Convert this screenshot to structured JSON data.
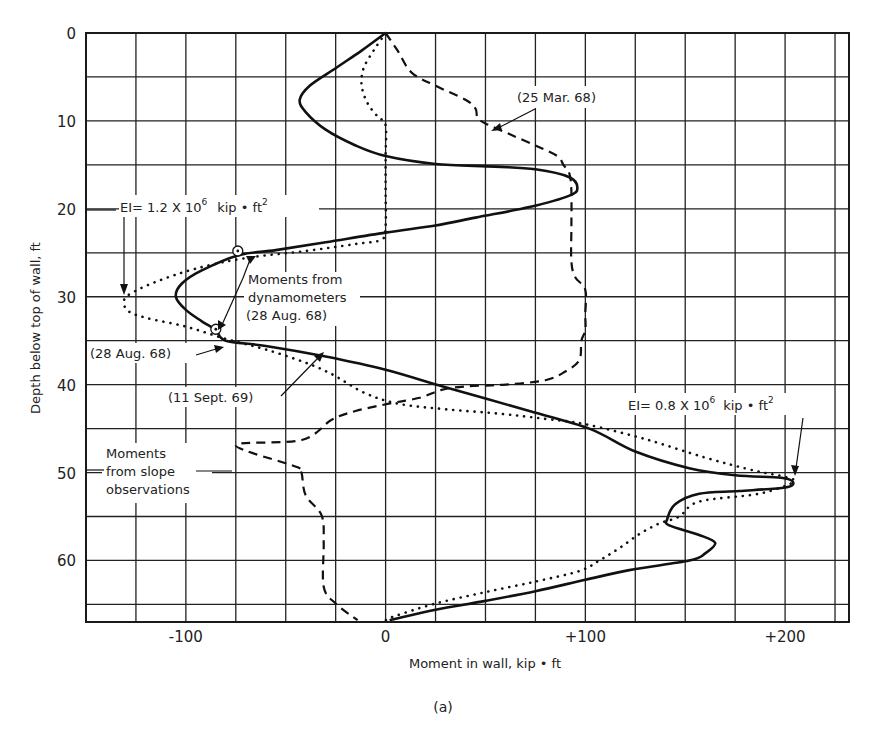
{
  "chart_data": {
    "type": "line",
    "title": "",
    "caption": "(a)",
    "xlabel": "Moment in wall, kip • ft",
    "ylabel": "Depth below top of wall, ft",
    "xlim": [
      -150,
      232
    ],
    "ylim": [
      0,
      67
    ],
    "y_inverted": true,
    "grid": true,
    "x_grid_step": 25,
    "y_grid_step": 5,
    "x_ticks": [
      {
        "value": -100,
        "label": "-100"
      },
      {
        "value": 0,
        "label": "0"
      },
      {
        "value": 100,
        "label": "+100"
      },
      {
        "value": 200,
        "label": "+200"
      }
    ],
    "y_ticks": [
      {
        "value": 0,
        "label": "0"
      },
      {
        "value": 10,
        "label": "10"
      },
      {
        "value": 20,
        "label": "20"
      },
      {
        "value": 30,
        "label": "30"
      },
      {
        "value": 40,
        "label": "40"
      },
      {
        "value": 50,
        "label": "50"
      },
      {
        "value": 60,
        "label": "60"
      }
    ],
    "series": [
      {
        "name": "(11 Sept. 69)",
        "style": "solid",
        "points": [
          [
            0,
            0
          ],
          [
            -12,
            2
          ],
          [
            -25,
            4
          ],
          [
            -38,
            6
          ],
          [
            -43,
            7.6
          ],
          [
            -40,
            9
          ],
          [
            -30,
            11
          ],
          [
            -15,
            12.8
          ],
          [
            0,
            14
          ],
          [
            25,
            14.9
          ],
          [
            55,
            15.2
          ],
          [
            75,
            15.5
          ],
          [
            92,
            16.4
          ],
          [
            96,
            17.6
          ],
          [
            92,
            18.5
          ],
          [
            72,
            19.8
          ],
          [
            45,
            21
          ],
          [
            25,
            21.9
          ],
          [
            0,
            22.7
          ],
          [
            -30,
            23.8
          ],
          [
            -55,
            24.7
          ],
          [
            -74,
            25.3
          ],
          [
            -92,
            27
          ],
          [
            -102,
            28.5
          ],
          [
            -105,
            30
          ],
          [
            -100,
            31.5
          ],
          [
            -92,
            32.8
          ],
          [
            -85,
            33.8
          ],
          [
            -80,
            35
          ],
          [
            -60,
            35.6
          ],
          [
            -30,
            36.8
          ],
          [
            0,
            38.3
          ],
          [
            30,
            40.3
          ],
          [
            72,
            43
          ],
          [
            102,
            45
          ],
          [
            125,
            47.6
          ],
          [
            152,
            49.5
          ],
          [
            175,
            50.3
          ],
          [
            198,
            50.6
          ],
          [
            204,
            51.1
          ],
          [
            200,
            51.7
          ],
          [
            177,
            52.1
          ],
          [
            157,
            52.4
          ],
          [
            145,
            53.6
          ],
          [
            141,
            55.3
          ],
          [
            142,
            56
          ],
          [
            157,
            57.1
          ],
          [
            165,
            58
          ],
          [
            160,
            59.2
          ],
          [
            152,
            60
          ],
          [
            122,
            61.1
          ],
          [
            100,
            62.2
          ],
          [
            75,
            63.5
          ],
          [
            50,
            64.6
          ],
          [
            25,
            65.6
          ],
          [
            2,
            66.8
          ]
        ]
      },
      {
        "name": "(28 Aug. 68)",
        "style": "dotted",
        "points": [
          [
            0,
            0
          ],
          [
            -6,
            2
          ],
          [
            -11,
            4
          ],
          [
            -12,
            6
          ],
          [
            -9,
            8
          ],
          [
            -4,
            9.5
          ],
          [
            0,
            10.5
          ],
          [
            0,
            14
          ],
          [
            0,
            18
          ],
          [
            0,
            22
          ],
          [
            -2,
            23.5
          ],
          [
            -15,
            24
          ],
          [
            -40,
            24.8
          ],
          [
            -70,
            25.6
          ],
          [
            -95,
            26.8
          ],
          [
            -115,
            28.3
          ],
          [
            -128,
            29.7
          ],
          [
            -131,
            30.5
          ],
          [
            -129,
            31.6
          ],
          [
            -120,
            32.4
          ],
          [
            -100,
            33.4
          ],
          [
            -80,
            34.8
          ],
          [
            -60,
            36
          ],
          [
            -40,
            37.5
          ],
          [
            -27,
            38.8
          ],
          [
            -10,
            41
          ],
          [
            7,
            42.2
          ],
          [
            30,
            42.8
          ],
          [
            57,
            43.3
          ],
          [
            80,
            43.9
          ],
          [
            100,
            44.5
          ],
          [
            130,
            46.2
          ],
          [
            160,
            48.3
          ],
          [
            185,
            49.8
          ],
          [
            200,
            50.5
          ],
          [
            204,
            51.1
          ],
          [
            187,
            52.4
          ],
          [
            157,
            53.3
          ],
          [
            147,
            55
          ],
          [
            137,
            55.8
          ],
          [
            127,
            57
          ],
          [
            117,
            58.6
          ],
          [
            107,
            60
          ],
          [
            97,
            61.2
          ],
          [
            75,
            62.4
          ],
          [
            50,
            63.6
          ],
          [
            25,
            64.9
          ],
          [
            5,
            66.3
          ],
          [
            0,
            66.8
          ]
        ]
      },
      {
        "name": "(25 Mar. 68)",
        "style": "dashed",
        "points": [
          [
            0,
            0
          ],
          [
            6,
            2
          ],
          [
            13,
            4.5
          ],
          [
            25,
            6
          ],
          [
            40,
            7.6
          ],
          [
            45,
            8.6
          ],
          [
            46,
            9.6
          ],
          [
            50,
            10.3
          ],
          [
            62,
            11.5
          ],
          [
            75,
            12.8
          ],
          [
            86,
            14
          ],
          [
            89,
            15
          ],
          [
            92,
            16
          ],
          [
            93,
            18
          ],
          [
            93,
            22
          ],
          [
            93,
            26
          ],
          [
            95,
            27.8
          ],
          [
            100,
            29.2
          ],
          [
            100,
            32
          ],
          [
            100,
            33.8
          ],
          [
            98,
            35
          ],
          [
            97,
            37.2
          ],
          [
            90,
            38.5
          ],
          [
            80,
            39.5
          ],
          [
            60,
            40
          ],
          [
            40,
            40.2
          ],
          [
            28,
            40.6
          ],
          [
            17,
            41.5
          ],
          [
            3,
            42.1
          ],
          [
            -15,
            43
          ],
          [
            -27,
            44
          ],
          [
            -42,
            46.3
          ],
          [
            -75,
            46.9
          ],
          [
            -44,
            49.4
          ],
          [
            -42,
            50.1
          ],
          [
            -40,
            52.6
          ],
          [
            -32,
            54.9
          ],
          [
            -31,
            58
          ],
          [
            -31,
            63
          ],
          [
            -25,
            64.9
          ],
          [
            -14,
            66.8
          ]
        ]
      }
    ],
    "markers": [
      {
        "name": "dynamometer-reading-1",
        "x": -74,
        "y": 24.8,
        "shape": "circle-dot"
      },
      {
        "name": "dynamometer-reading-2",
        "x": -85,
        "y": 33.7,
        "shape": "circle-dot"
      }
    ],
    "annotations": [
      {
        "id": "mar68",
        "text": "(25 Mar. 68)"
      },
      {
        "id": "ei12_main",
        "text": "EI= 1.2 X 10",
        "sup": "6",
        "tail": "kip • ft",
        "tail_sup": "2"
      },
      {
        "id": "dyn1",
        "text": "Moments from"
      },
      {
        "id": "dyn2",
        "text": "dynamometers"
      },
      {
        "id": "dyn3",
        "text": "(28 Aug. 68)"
      },
      {
        "id": "aug68",
        "text": "(28 Aug. 68)"
      },
      {
        "id": "sep69",
        "text": "(11 Sept. 69)"
      },
      {
        "id": "slope1",
        "text": "Moments"
      },
      {
        "id": "slope2",
        "text": "from slope"
      },
      {
        "id": "slope3",
        "text": "observations"
      },
      {
        "id": "ei08_main",
        "text": "EI= 0.8 X 10",
        "sup": "6",
        "tail": "kip • ft",
        "tail_sup": "2"
      }
    ]
  }
}
